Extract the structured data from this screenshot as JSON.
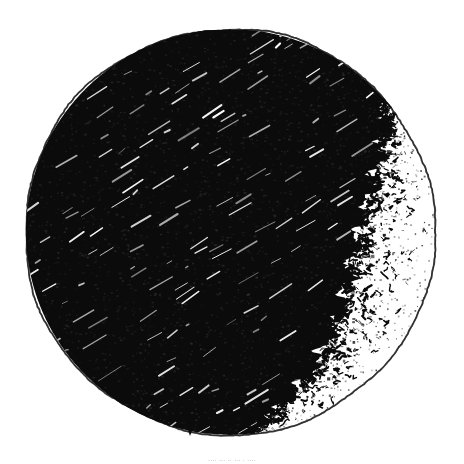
{
  "figure": {
    "kind": "astronomical-disk-drawing",
    "background_color": "#ffffff",
    "ink_color": "#000000",
    "outline_color": "#1a1a1a",
    "caption_color": "#b9b9b9",
    "caption_text": "....  ... .. ...  . ....",
    "caption_legible": "false"
  },
  "disk": {
    "center_x": 230,
    "center_y": 232,
    "radius_x": 205,
    "radius_y": 203,
    "outline_width": 1.2,
    "left_edge_x": 25,
    "right_edge_x": 435,
    "top_edge_y": 29,
    "bottom_edge_y": 435
  },
  "shading": {
    "style": "dense-diagonal-hatching",
    "hatch_angle_deg": -32,
    "hatch_spacing": 7,
    "coverage_note": "solid black over left and central disk, fading at right limb",
    "terminator_style": "stippled-squiggle",
    "highlight_streak_color": "#ffffff"
  },
  "chart_data": {
    "type": "scatter",
    "xlabel": "",
    "ylabel": "",
    "grid": "off",
    "legend": "none",
    "xlim": [
      25,
      435
    ],
    "ylim": [
      29,
      435
    ],
    "series": [
      {
        "name": "illuminated-limb-outline",
        "description": "thin ink circle marking the full disk boundary",
        "values": [
          1
        ]
      },
      {
        "name": "shadowed-region",
        "description": "dense black hatched area covering roughly the western four fifths of the disk",
        "values": [
          0.8
        ]
      },
      {
        "name": "terminator-zone",
        "description": "ragged stippled transition band along the eastern limb",
        "values": [
          0.2
        ]
      }
    ]
  }
}
